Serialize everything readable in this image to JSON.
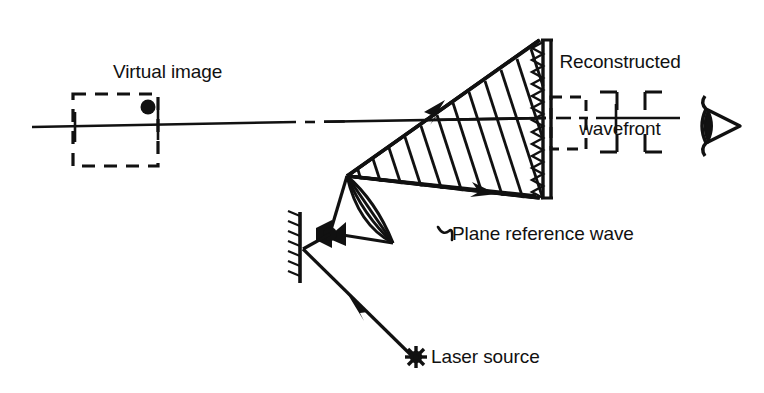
{
  "diagram": {
    "title_text": "",
    "labels": {
      "reconstructed_wavefront": "Reconstructed\nwavefront",
      "reconstructed_wavefront_line1": "Reconstructed",
      "reconstructed_wavefront_line2": "wavefront",
      "virtual_image": "Virtual image",
      "plane_reference_wave": "Plane reference wave",
      "laser_source": "Laser source"
    },
    "icons": {
      "eye": "eye-icon",
      "laser_starburst": "starburst-icon",
      "mirror": "mirror-icon",
      "beam_expander": "beam-expander-icon",
      "lens": "diverging-lens-icon",
      "hologram_plate": "hologram-plate-icon"
    },
    "colors": {
      "ink": "#111111",
      "background": "#ffffff"
    }
  }
}
